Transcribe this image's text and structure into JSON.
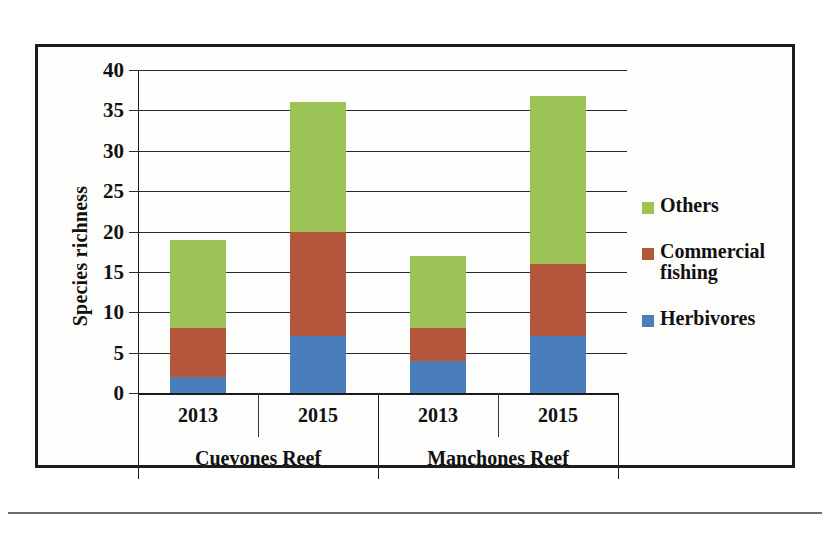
{
  "chart_data": {
    "type": "bar",
    "subtype": "stacked-bar-grouped",
    "title": "",
    "xlabel": "",
    "ylabel": "Species richness",
    "ylim": [
      0,
      40
    ],
    "ytick_step": 5,
    "ytick_labels": [
      "40",
      "35",
      "30",
      "25",
      "20",
      "15",
      "10",
      "5",
      "0"
    ],
    "ytick_values": [
      40,
      35,
      30,
      25,
      20,
      15,
      10,
      5,
      0
    ],
    "grid": true,
    "legend_position": "right",
    "categories": [
      "2013",
      "2015",
      "2013",
      "2015"
    ],
    "groups": [
      {
        "label": "Cuevones Reef",
        "categories": [
          "2013",
          "2015"
        ]
      },
      {
        "label": "Manchones Reef",
        "categories": [
          "2013",
          "2015"
        ]
      }
    ],
    "series": [
      {
        "name": "Herbivores",
        "color": "#4a7ebb",
        "values": [
          2,
          7,
          4,
          7
        ]
      },
      {
        "name": "Commercial fishing",
        "color": "#b4573c",
        "values": [
          6,
          13,
          4,
          9
        ]
      },
      {
        "name": "Others",
        "color": "#9bc356",
        "values": [
          11,
          16,
          9,
          20.8
        ]
      }
    ],
    "totals": [
      19,
      36,
      17,
      36.8
    ],
    "bars": [
      {
        "group": "Cuevones Reef",
        "year": "2013",
        "herbivores": 2,
        "commercial_fishing": 6,
        "others": 11,
        "total": 19
      },
      {
        "group": "Cuevones Reef",
        "year": "2015",
        "herbivores": 7,
        "commercial_fishing": 13,
        "others": 16,
        "total": 36
      },
      {
        "group": "Manchones Reef",
        "year": "2013",
        "herbivores": 4,
        "commercial_fishing": 4,
        "others": 9,
        "total": 17
      },
      {
        "group": "Manchones Reef",
        "year": "2015",
        "herbivores": 7,
        "commercial_fishing": 9,
        "others": 20.8,
        "total": 36.8
      }
    ]
  },
  "axis": {
    "y_title": "Species richness",
    "ticks": [
      {
        "label": "40",
        "value": 40
      },
      {
        "label": "35",
        "value": 35
      },
      {
        "label": "30",
        "value": 30
      },
      {
        "label": "25",
        "value": 25
      },
      {
        "label": "20",
        "value": 20
      },
      {
        "label": "15",
        "value": 15
      },
      {
        "label": "10",
        "value": 10
      },
      {
        "label": "5",
        "value": 5
      },
      {
        "label": "0",
        "value": 0
      }
    ]
  },
  "category_axis": {
    "years": [
      "2013",
      "2015",
      "2013",
      "2015"
    ],
    "sites": [
      "Cuevones Reef",
      "Manchones Reef"
    ]
  },
  "legend": {
    "items": [
      {
        "label": "Others",
        "color": "#9bc356",
        "swatch": "legend-swatch-others"
      },
      {
        "label": "Commercial fishing",
        "color": "#b4573c",
        "swatch": "legend-swatch-commercial-fishing"
      },
      {
        "label": "Herbivores",
        "color": "#4a7ebb",
        "swatch": "legend-swatch-herbivores"
      }
    ]
  },
  "colors": {
    "herbivores": "#4a7ebb",
    "commercial_fishing": "#b4573c",
    "others": "#9bc356",
    "frame": "#1c1c1c",
    "gridline": "#2b2b2b",
    "background": "#fdfdfc"
  }
}
